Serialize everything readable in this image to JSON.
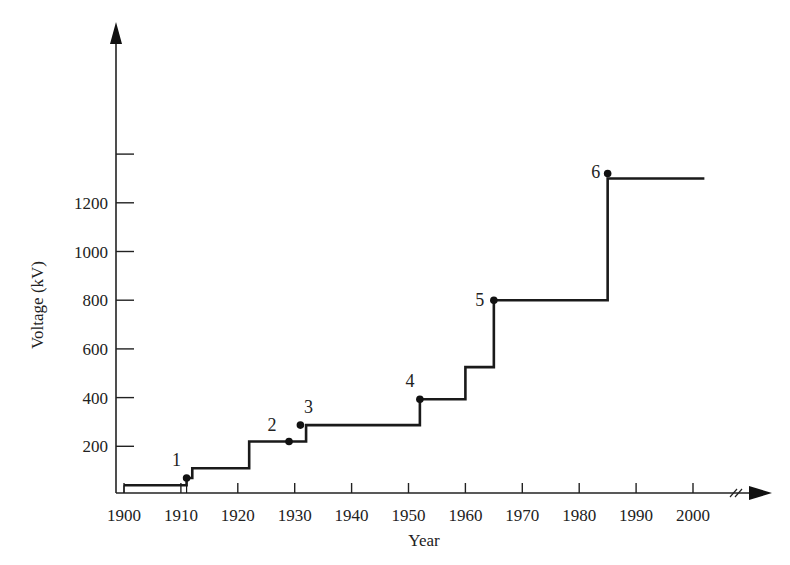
{
  "chart_data": {
    "type": "line",
    "subtype": "step",
    "title": "",
    "xlabel": "Year",
    "ylabel": "Voltage (kV)",
    "xlim": [
      1900,
      2010
    ],
    "ylim": [
      0,
      1450
    ],
    "x_ticks": [
      1900,
      1910,
      1920,
      1930,
      1940,
      1950,
      1960,
      1970,
      1980,
      1990,
      2000
    ],
    "x_tick_labels": [
      "1900",
      "1910",
      "1920",
      "1930",
      "1940",
      "1950",
      "1960",
      "1970",
      "1980",
      "1990",
      "2000"
    ],
    "y_ticks": [
      200,
      400,
      600,
      800,
      1000,
      1200,
      1400
    ],
    "y_tick_labels": [
      "200",
      "400",
      "600",
      "800",
      "1000",
      "1200",
      ""
    ],
    "grid": false,
    "x_axis_break": true,
    "series": [
      {
        "name": "Maximum transmission voltage",
        "steps": [
          {
            "x": 1900,
            "y": 40
          },
          {
            "x": 1911,
            "y": 70
          },
          {
            "x": 1912,
            "y": 110
          },
          {
            "x": 1922,
            "y": 220
          },
          {
            "x": 1932,
            "y": 287
          },
          {
            "x": 1952,
            "y": 393
          },
          {
            "x": 1960,
            "y": 525
          },
          {
            "x": 1965,
            "y": 800
          },
          {
            "x": 1985,
            "y": 1300
          },
          {
            "x": 2002,
            "y": 1300
          }
        ]
      }
    ],
    "annotations": [
      {
        "label": "1",
        "x": 1911,
        "y": 70
      },
      {
        "label": "2",
        "x": 1929,
        "y": 220
      },
      {
        "label": "3",
        "x": 1931,
        "y": 287
      },
      {
        "label": "4",
        "x": 1952,
        "y": 393
      },
      {
        "label": "5",
        "x": 1965,
        "y": 800
      },
      {
        "label": "6",
        "x": 1985,
        "y": 1320
      }
    ]
  }
}
